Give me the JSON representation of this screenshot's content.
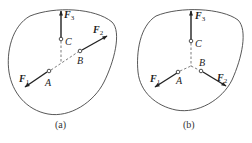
{
  "figure": {
    "panels": [
      {
        "id": "a",
        "caption": "(a)",
        "points": {
          "A": "A",
          "B": "B",
          "C": "C"
        },
        "forces": [
          {
            "name": "F",
            "sub": "1",
            "at": "A",
            "direction": "down-left, along line AB"
          },
          {
            "name": "F",
            "sub": "2",
            "at": "B",
            "direction": "up-right, along line AB"
          },
          {
            "name": "F",
            "sub": "3",
            "at": "C",
            "direction": "up"
          }
        ]
      },
      {
        "id": "b",
        "caption": "(b)",
        "points": {
          "A": "A",
          "B": "B",
          "C": "C"
        },
        "forces": [
          {
            "name": "F",
            "sub": "1",
            "at": "A",
            "direction": "down-left"
          },
          {
            "name": "F",
            "sub": "2",
            "at": "B",
            "direction": "down-right"
          },
          {
            "name": "F",
            "sub": "3",
            "at": "C",
            "direction": "up"
          }
        ]
      }
    ],
    "colors": {
      "stroke": "#333333",
      "background": "#ffffff"
    }
  }
}
